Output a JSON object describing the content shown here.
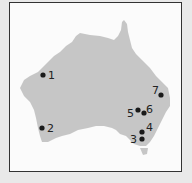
{
  "map": {
    "region": "Australia",
    "land_color": "#c6c6c6",
    "marker_color": "#1a1a1a",
    "markers": [
      {
        "label": "1",
        "x": 43,
        "y": 75,
        "lx": 48,
        "ly": 79
      },
      {
        "label": "2",
        "x": 42,
        "y": 128,
        "lx": 47,
        "ly": 132
      },
      {
        "label": "3",
        "x": 142,
        "y": 139,
        "lx": 130,
        "ly": 143
      },
      {
        "label": "4",
        "x": 142,
        "y": 132,
        "lx": 146,
        "ly": 131
      },
      {
        "label": "5",
        "x": 138,
        "y": 110,
        "lx": 127,
        "ly": 117
      },
      {
        "label": "6",
        "x": 144,
        "y": 113,
        "lx": 146,
        "ly": 113
      },
      {
        "label": "7",
        "x": 161,
        "y": 95,
        "lx": 152,
        "ly": 94
      }
    ]
  }
}
